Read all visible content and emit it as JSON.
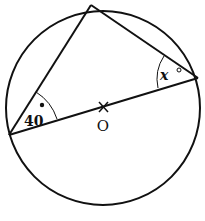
{
  "diagram": {
    "type": "circle-geometry",
    "circle": {
      "cx": 103,
      "cy": 108,
      "r": 97,
      "stroke": "#111111"
    },
    "center": {
      "x": 103,
      "y": 107,
      "marker": "×",
      "label": "O"
    },
    "vertices": {
      "top": {
        "x": 91,
        "y": 5
      },
      "left": {
        "x": 9,
        "y": 135
      },
      "right": {
        "x": 198,
        "y": 78
      }
    },
    "diameter": {
      "from": "left",
      "to": "right",
      "through": "O"
    },
    "angles": [
      {
        "vertex": "left",
        "label": "40",
        "degree_symbol": "°"
      },
      {
        "vertex": "right",
        "label": "x",
        "degree_symbol": "°"
      }
    ]
  }
}
